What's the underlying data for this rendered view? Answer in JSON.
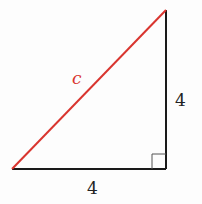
{
  "diagram": {
    "type": "right-triangle",
    "hypotenuse_label": "c",
    "vertical_leg_label": "4",
    "horizontal_leg_label": "4",
    "colors": {
      "hypotenuse": "#d9352f",
      "legs": "#1a1a1a",
      "right_angle_marker": "#555555"
    },
    "vertices": {
      "top": [
        166,
        10
      ],
      "bottom_left": [
        12,
        169
      ],
      "bottom_right": [
        166,
        169
      ]
    }
  }
}
